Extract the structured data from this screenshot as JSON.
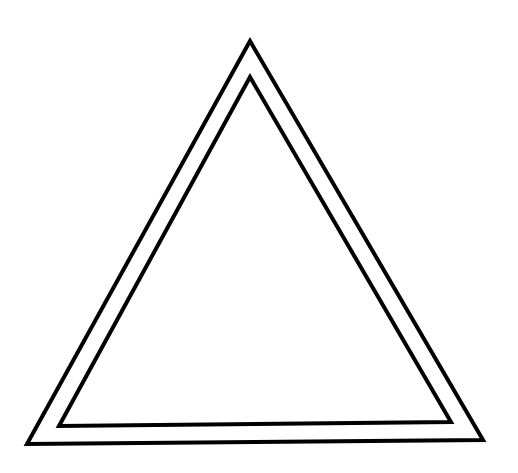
{
  "diagram": {
    "background_color": "#ffffff",
    "stroke_color": "#000000",
    "stroke_width": 4,
    "shapes": [
      {
        "name": "outer-triangle",
        "points": "250,41 27,444 483,440"
      },
      {
        "name": "inner-triangle",
        "points": "250,77 59,426 451,422"
      }
    ]
  }
}
